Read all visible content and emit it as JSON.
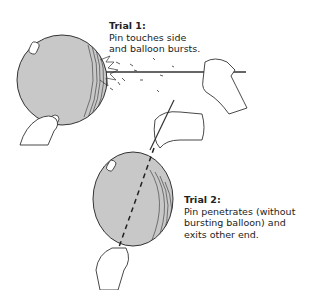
{
  "trial1": {
    "title": "Trial 1:",
    "line1": "Pin touches side",
    "line2": "and balloon bursts."
  },
  "trial2": {
    "title": "Trial 2:",
    "line1": "Pin penetrates (without",
    "line2": "bursting balloon) and",
    "line3": "exits other end."
  },
  "colors": {
    "balloon": "#c8c8c8",
    "outline": "#333333"
  }
}
